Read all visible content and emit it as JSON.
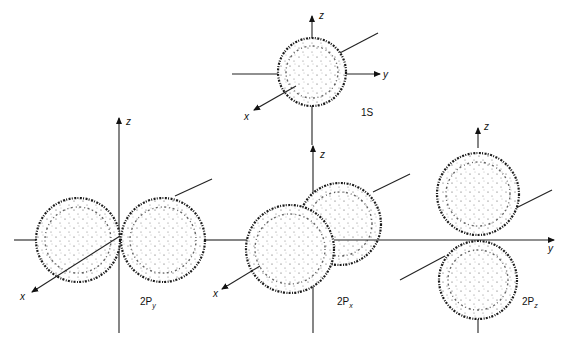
{
  "figure": {
    "orbitals": [
      {
        "id": "1s",
        "label": "1S",
        "axes": {
          "x": "x",
          "y": "y",
          "z": "z"
        }
      },
      {
        "id": "2py",
        "label": "2P",
        "subscript": "y",
        "axes": {
          "x": "x",
          "z": "z"
        }
      },
      {
        "id": "2px",
        "label": "2P",
        "subscript": "x",
        "axes": {
          "x": "x",
          "z": "z"
        }
      },
      {
        "id": "2pz",
        "label": "2P",
        "subscript": "z",
        "axes": {
          "x": "x",
          "y": "y",
          "z": "z"
        }
      }
    ]
  }
}
